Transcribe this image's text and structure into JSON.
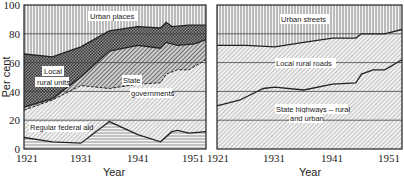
{
  "chart_data": [
    {
      "type": "area",
      "stacked": true,
      "title": "",
      "xlabel": "Year",
      "ylabel": "Per cent",
      "xlim": [
        1921,
        1953
      ],
      "ylim": [
        0,
        100
      ],
      "x_ticks": [
        "1921",
        "1931",
        "1941",
        "1951"
      ],
      "y_ticks": [
        "0",
        "20",
        "40",
        "60",
        "80",
        "100"
      ],
      "grid": "horizontal at 20, 40, 60, 80",
      "legend": "inline annotations",
      "series_boundaries_cumulative_percent": [
        {
          "name": "Regular federal aid",
          "x": [
            1921,
            1926,
            1931,
            1936,
            1941,
            1945,
            1947,
            1948,
            1950,
            1953
          ],
          "top": [
            8,
            5,
            4,
            19,
            10,
            5,
            12,
            13,
            11,
            12
          ]
        },
        {
          "name": "State governments",
          "x": [
            1921,
            1926,
            1931,
            1936,
            1941,
            1945,
            1946,
            1948,
            1950,
            1953
          ],
          "top": [
            27,
            34,
            44,
            42,
            45,
            46,
            52,
            55,
            55,
            62
          ]
        },
        {
          "name": "Local rural units",
          "x": [
            1921,
            1926,
            1931,
            1936,
            1941,
            1945,
            1946,
            1948,
            1951,
            1953
          ],
          "top": [
            29,
            35,
            50,
            68,
            72,
            70,
            74,
            72,
            73,
            76
          ]
        },
        {
          "name": "Local rural units (upper band)",
          "x": [
            1921,
            1926,
            1931,
            1936,
            1941,
            1945,
            1946,
            1947,
            1950,
            1953
          ],
          "top": [
            66,
            64,
            71,
            82,
            85,
            84,
            88,
            85,
            86,
            86
          ]
        },
        {
          "name": "Urban places",
          "x": [
            1921,
            1953
          ],
          "top": [
            100,
            100
          ]
        }
      ],
      "annotations": [
        "Urban places",
        "Local",
        "rural units",
        "State",
        "governments",
        "Regular federal aid"
      ]
    },
    {
      "type": "area",
      "stacked": true,
      "title": "",
      "xlabel": "Year",
      "ylabel": "",
      "xlim": [
        1921,
        1953
      ],
      "ylim": [
        0,
        100
      ],
      "x_ticks": [
        "1921",
        "1931",
        "1941",
        "1951"
      ],
      "grid": "horizontal at 20, 40, 60, 80",
      "legend": "inline annotations",
      "series_boundaries_cumulative_percent": [
        {
          "name": "State highways – rural and urban",
          "x": [
            1921,
            1925,
            1929,
            1931,
            1936,
            1941,
            1945,
            1946,
            1948,
            1950,
            1953
          ],
          "top": [
            30,
            34,
            42,
            43,
            41,
            45,
            46,
            52,
            55,
            55,
            62
          ]
        },
        {
          "name": "Local rural roads",
          "x": [
            1921,
            1926,
            1931,
            1936,
            1941,
            1945,
            1946,
            1950,
            1953
          ],
          "top": [
            72,
            72,
            71,
            74,
            77,
            77,
            80,
            80,
            83
          ]
        },
        {
          "name": "Urban streets",
          "x": [
            1921,
            1953
          ],
          "top": [
            100,
            100
          ]
        }
      ],
      "annotations": [
        "Urban streets",
        "Local rural roads",
        "State highways – rural",
        "and urban"
      ]
    }
  ],
  "left": {
    "ylabel": "Per cent",
    "xlabel": "Year",
    "y_ticks": [
      "100",
      "80",
      "60",
      "40",
      "20",
      "0"
    ],
    "x_ticks": [
      "1921",
      "1931",
      "1941",
      "1951"
    ],
    "labels": {
      "urban": "Urban places",
      "local1": "Local",
      "local2": "rural units",
      "state1": "State",
      "state2": "governments",
      "federal": "Regular federal aid"
    }
  },
  "right": {
    "xlabel": "Year",
    "x_ticks": [
      "1921",
      "1931",
      "1941",
      "1951"
    ],
    "labels": {
      "urban": "Urban streets",
      "local": "Local rural roads",
      "state1": "State highways – rural",
      "state2": "and urban"
    }
  },
  "colors": {
    "ink": "#222222",
    "grid": "#444444",
    "fill_light": "#f2f2f2",
    "fill_mid": "#bdbdbd",
    "fill_dark": "#7a7a7a"
  }
}
